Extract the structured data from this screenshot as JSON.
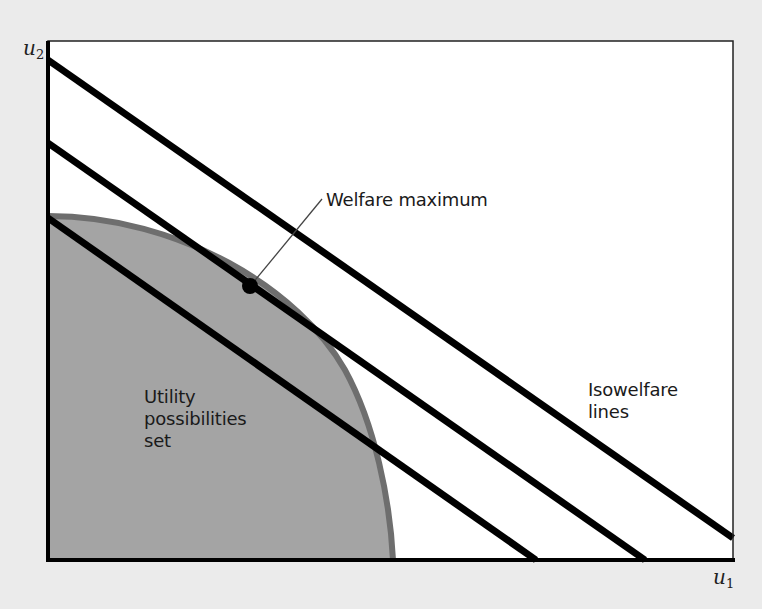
{
  "diagram": {
    "axes": {
      "x_label": "u",
      "x_subscript": "1",
      "y_label": "u",
      "y_subscript": "2"
    },
    "annotations": {
      "welfare_max": "Welfare maximum",
      "isowelfare_line1": "Isowelfare",
      "isowelfare_line2": "lines",
      "ups_line1": "Utility",
      "ups_line2": "possibilities",
      "ups_line3": "set"
    },
    "elements": {
      "isowelfare_lines": 3,
      "utility_possibilities_set": "concave frontier region (shaded gray)",
      "optimum_point": "tangency of middle isowelfare line with frontier"
    },
    "colors": {
      "background": "#ebebeb",
      "plot_area": "#ffffff",
      "set_fill": "#a4a4a4",
      "frontier_edge": "#6e6e6e",
      "lines": "#000000"
    }
  }
}
